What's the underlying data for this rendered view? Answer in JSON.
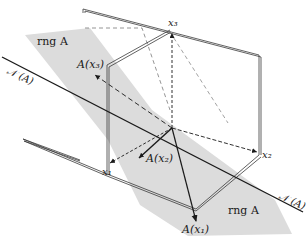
{
  "diagram": {
    "title": "",
    "colors": {
      "background": "#ffffff",
      "plane_fill": "#dcdcdc",
      "frame_stroke": "#3a3a3a",
      "line_stroke": "#1a1a1a",
      "dashed_stroke": "#6a6a6a"
    },
    "labels": {
      "rng_top": "rng A",
      "rng_bottom": "rng A",
      "null_left": "𝒩 (A)",
      "null_right": "𝒩 (A)",
      "x1": "x₁",
      "x2": "x₂",
      "x3": "x₃",
      "Ax1": "A(x₁)",
      "Ax2": "A(x₂)",
      "Ax3": "A(x₃)"
    },
    "elements": [
      {
        "id": "rng-plane",
        "kind": "shaded-plane",
        "label": "rng A"
      },
      {
        "id": "null-line",
        "kind": "line",
        "label": "𝒩 (A)"
      },
      {
        "id": "coordinate-frame",
        "kind": "three orthogonal planes"
      },
      {
        "id": "x1-axis",
        "kind": "dashed vector",
        "label": "x₁"
      },
      {
        "id": "x2-axis",
        "kind": "dashed vector",
        "label": "x₂"
      },
      {
        "id": "x3-axis",
        "kind": "dashed vector",
        "label": "x₃"
      },
      {
        "id": "Ax1",
        "kind": "vector",
        "label": "A(x₁)"
      },
      {
        "id": "Ax2",
        "kind": "vector",
        "label": "A(x₂)"
      },
      {
        "id": "Ax3",
        "kind": "dashed vector",
        "label": "A(x₃)"
      }
    ]
  }
}
